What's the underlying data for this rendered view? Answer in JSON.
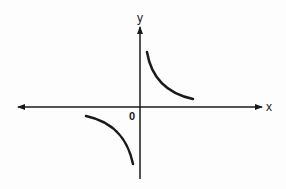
{
  "diagram": {
    "type": "function-graph",
    "axes": {
      "x_label": "x",
      "y_label": "y",
      "origin_label": "0"
    },
    "curves": [
      {
        "name": "branch-quadrant-1",
        "quadrant": "I"
      },
      {
        "name": "branch-quadrant-3",
        "quadrant": "III"
      }
    ],
    "colors": {
      "stroke": "#1a1a1a",
      "background": "#fdfdfd"
    }
  }
}
